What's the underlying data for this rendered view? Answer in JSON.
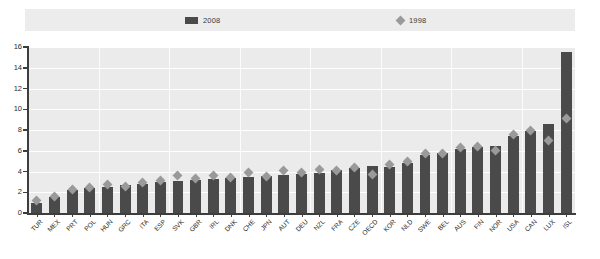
{
  "legend": {
    "series_2008_label": "2008",
    "series_1998_label": "1998",
    "series_2008_color": "#4a4a4a",
    "series_1998_color": "#9a9a9a"
  },
  "axis": {
    "y_ticks": [
      "0",
      "2",
      "4",
      "6",
      "8",
      "10",
      "12",
      "14",
      "16"
    ]
  },
  "chart_data": {
    "type": "bar",
    "title": "",
    "subtitle": "",
    "xlabel": "",
    "ylabel": "",
    "ylim": [
      0,
      16
    ],
    "ytick_step": 2,
    "grid": true,
    "legend_position": "top",
    "categories": [
      "TUR",
      "MEX",
      "PRT",
      "POL",
      "HUN",
      "GRC",
      "ITA",
      "ESP",
      "SVK",
      "GBR",
      "IRL",
      "DNK",
      "CHE",
      "JPN",
      "AUT",
      "DEU",
      "NZL",
      "FRA",
      "CZE",
      "OECD",
      "KOR",
      "NLD",
      "SWE",
      "BEL",
      "AUS",
      "FIN",
      "NOR",
      "USA",
      "CAN",
      "LUX",
      "ISL"
    ],
    "series": [
      {
        "name": "2008",
        "type": "bar",
        "color": "#4a4a4a",
        "values": [
          1.0,
          1.5,
          2.2,
          2.4,
          2.5,
          2.7,
          2.8,
          3.0,
          3.1,
          3.2,
          3.3,
          3.4,
          3.5,
          3.6,
          3.7,
          3.8,
          3.9,
          4.1,
          4.3,
          4.5,
          4.4,
          4.8,
          5.6,
          5.8,
          6.2,
          6.4,
          6.5,
          7.4,
          7.9,
          8.6,
          15.5
        ]
      },
      {
        "name": "1998",
        "type": "scatter-marker",
        "color": "#9a9a9a",
        "marker": "diamond",
        "values": [
          1.2,
          1.6,
          2.3,
          2.5,
          2.7,
          2.6,
          2.9,
          3.1,
          3.6,
          3.3,
          3.6,
          3.4,
          3.9,
          3.5,
          4.1,
          3.9,
          4.2,
          4.1,
          4.4,
          3.7,
          4.7,
          5.0,
          5.7,
          5.7,
          6.3,
          6.4,
          6.0,
          7.6,
          8.0,
          7.0,
          9.1
        ]
      }
    ]
  }
}
